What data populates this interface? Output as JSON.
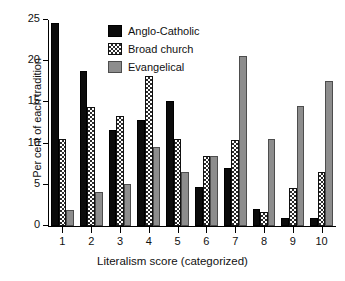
{
  "chart_data": {
    "type": "bar",
    "title": "",
    "xlabel": "Literalism score (categorized)",
    "ylabel": "Per cent of each tradition",
    "categories": [
      "1",
      "2",
      "3",
      "4",
      "5",
      "6",
      "7",
      "8",
      "9",
      "10"
    ],
    "series": [
      {
        "name": "Anglo-Catholic",
        "fill": "solid-black",
        "color": "#0b0b0b",
        "values": [
          24.6,
          18.8,
          11.7,
          12.9,
          15.2,
          4.7,
          7.0,
          2.1,
          1.0,
          1.0
        ]
      },
      {
        "name": "Broad church",
        "fill": "checkered-hatch",
        "color": "#2b2b2b",
        "values": [
          10.5,
          14.4,
          13.4,
          18.2,
          10.5,
          8.5,
          10.4,
          1.7,
          4.6,
          6.5
        ]
      },
      {
        "name": "Evangelical",
        "fill": "solid-gray",
        "color": "#8d8d8d",
        "values": [
          2.0,
          4.1,
          5.1,
          9.6,
          6.5,
          8.5,
          20.6,
          10.5,
          14.6,
          17.6
        ]
      }
    ],
    "ylim": [
      0,
      25
    ],
    "yticks": [
      0,
      5,
      10,
      15,
      20,
      25
    ],
    "ytick_labels": [
      "0",
      "5",
      "10",
      "15",
      "20",
      "25"
    ],
    "grid": false,
    "legend_position": "top-center"
  }
}
